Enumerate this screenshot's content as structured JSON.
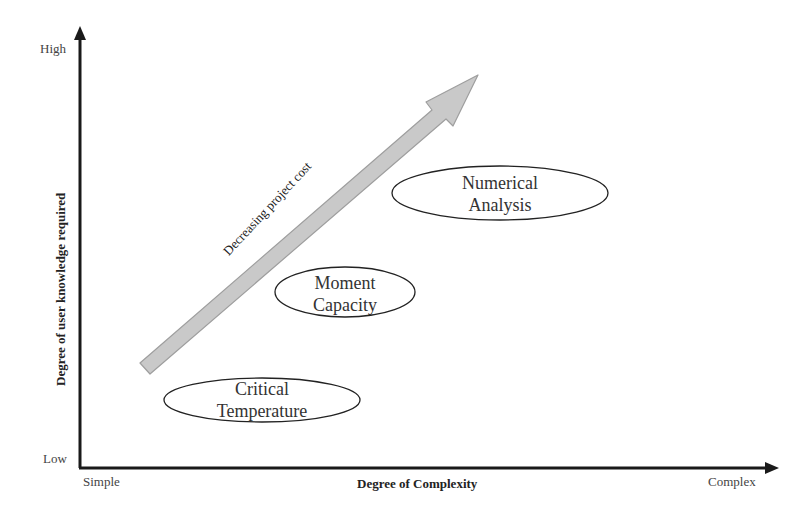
{
  "diagram": {
    "type": "conceptual quadrant diagram",
    "y_axis": {
      "title": "Degree of user knowledge required",
      "high_label": "High",
      "low_label": "Low"
    },
    "x_axis": {
      "title": "Degree of Complexity",
      "start_label": "Simple",
      "end_label": "Complex"
    },
    "trend_arrow": {
      "label": "Decreasing project cost",
      "color": "#c8c8c8"
    },
    "methods": [
      {
        "line1": "Critical",
        "line2": "Temperature"
      },
      {
        "line1": "Moment",
        "line2": "Capacity"
      },
      {
        "line1": "Numerical",
        "line2": "Analysis"
      }
    ]
  }
}
